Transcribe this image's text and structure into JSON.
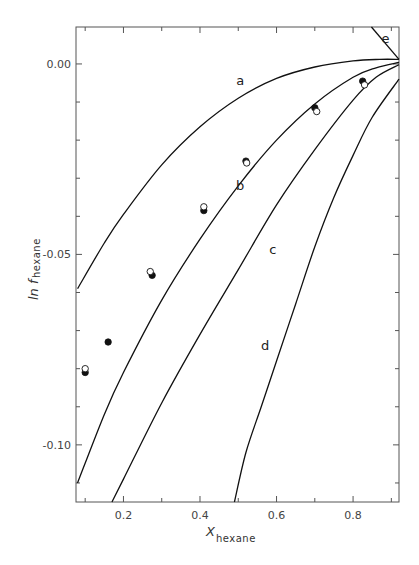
{
  "chart_data": {
    "type": "line",
    "title": "",
    "xlabel": "X",
    "xlabel_subscript": "hexane",
    "ylabel": "ln f",
    "ylabel_subscript": "hexane",
    "xlim": [
      0.076,
      0.92
    ],
    "ylim": [
      -0.115,
      0.0097
    ],
    "x_ticks": [
      0.2,
      0.4,
      0.6,
      0.8
    ],
    "x_tick_labels": [
      "0.2",
      "0.4",
      "0.6",
      "0.8"
    ],
    "x_minor_ticks": [
      0.1,
      0.3,
      0.5,
      0.7,
      0.9
    ],
    "y_ticks": [
      0.0,
      -0.05,
      -0.1
    ],
    "y_tick_labels": [
      "0.00",
      "-0.05",
      "-0.10"
    ],
    "y_minor_ticks": [
      -0.01,
      -0.02,
      -0.03,
      -0.04,
      -0.06,
      -0.07,
      -0.08,
      -0.09,
      -0.11
    ],
    "grid": false,
    "legend": null,
    "series": [
      {
        "name": "a",
        "kind": "curve",
        "x": [
          0.08,
          0.15,
          0.2,
          0.3,
          0.4,
          0.5,
          0.6,
          0.7,
          0.8,
          0.87,
          0.92
        ],
        "y": [
          -0.059,
          -0.047,
          -0.0395,
          -0.0265,
          -0.0165,
          -0.009,
          -0.0038,
          -0.0008,
          0.0008,
          0.0012,
          0.0012
        ]
      },
      {
        "name": "b",
        "kind": "curve",
        "x": [
          0.08,
          0.15,
          0.2,
          0.3,
          0.4,
          0.5,
          0.6,
          0.7,
          0.8,
          0.86,
          0.92
        ],
        "y": [
          -0.11,
          -0.092,
          -0.081,
          -0.062,
          -0.046,
          -0.032,
          -0.02,
          -0.0105,
          -0.0035,
          -0.001,
          0.0004
        ]
      },
      {
        "name": "c",
        "kind": "curve",
        "x": [
          0.17,
          0.2,
          0.3,
          0.4,
          0.5,
          0.6,
          0.7,
          0.8,
          0.86,
          0.92
        ],
        "y": [
          -0.115,
          -0.109,
          -0.089,
          -0.071,
          -0.054,
          -0.037,
          -0.0225,
          -0.0095,
          -0.0035,
          -0.0002
        ]
      },
      {
        "name": "d",
        "kind": "curve",
        "x": [
          0.49,
          0.52,
          0.56,
          0.6,
          0.65,
          0.7,
          0.75,
          0.8,
          0.85,
          0.92
        ],
        "y": [
          -0.115,
          -0.102,
          -0.09,
          -0.078,
          -0.063,
          -0.048,
          -0.035,
          -0.024,
          -0.014,
          -0.004
        ]
      },
      {
        "name": "e",
        "kind": "curve",
        "x": [
          0.848,
          0.92
        ],
        "y": [
          0.0097,
          0.0012
        ]
      },
      {
        "name": "experimental (filled)",
        "kind": "points-filled",
        "x": [
          0.1,
          0.16,
          0.275,
          0.41,
          0.52,
          0.7,
          0.825
        ],
        "y": [
          -0.081,
          -0.073,
          -0.0555,
          -0.0385,
          -0.0255,
          -0.0115,
          -0.0045
        ]
      },
      {
        "name": "experimental (open)",
        "kind": "points-open",
        "x": [
          0.1,
          0.27,
          0.41,
          0.522,
          0.705,
          0.83
        ],
        "y": [
          -0.08,
          -0.0545,
          -0.0375,
          -0.026,
          -0.0125,
          -0.0055
        ]
      }
    ],
    "annotations": [
      {
        "text": "a",
        "x": 0.505,
        "y": -0.0055
      },
      {
        "text": "b",
        "x": 0.505,
        "y": -0.033
      },
      {
        "text": "c",
        "x": 0.59,
        "y": -0.05
      },
      {
        "text": "d",
        "x": 0.57,
        "y": -0.075
      },
      {
        "text": "e",
        "x": 0.885,
        "y": 0.0055
      }
    ]
  },
  "plot_area": {
    "left": 76,
    "right": 399,
    "top": 27,
    "bottom": 502
  },
  "labels": {
    "x_axis_main": "X",
    "x_axis_sub": "hexane",
    "y_axis_main": "ln f",
    "y_axis_sub": "hexane"
  }
}
